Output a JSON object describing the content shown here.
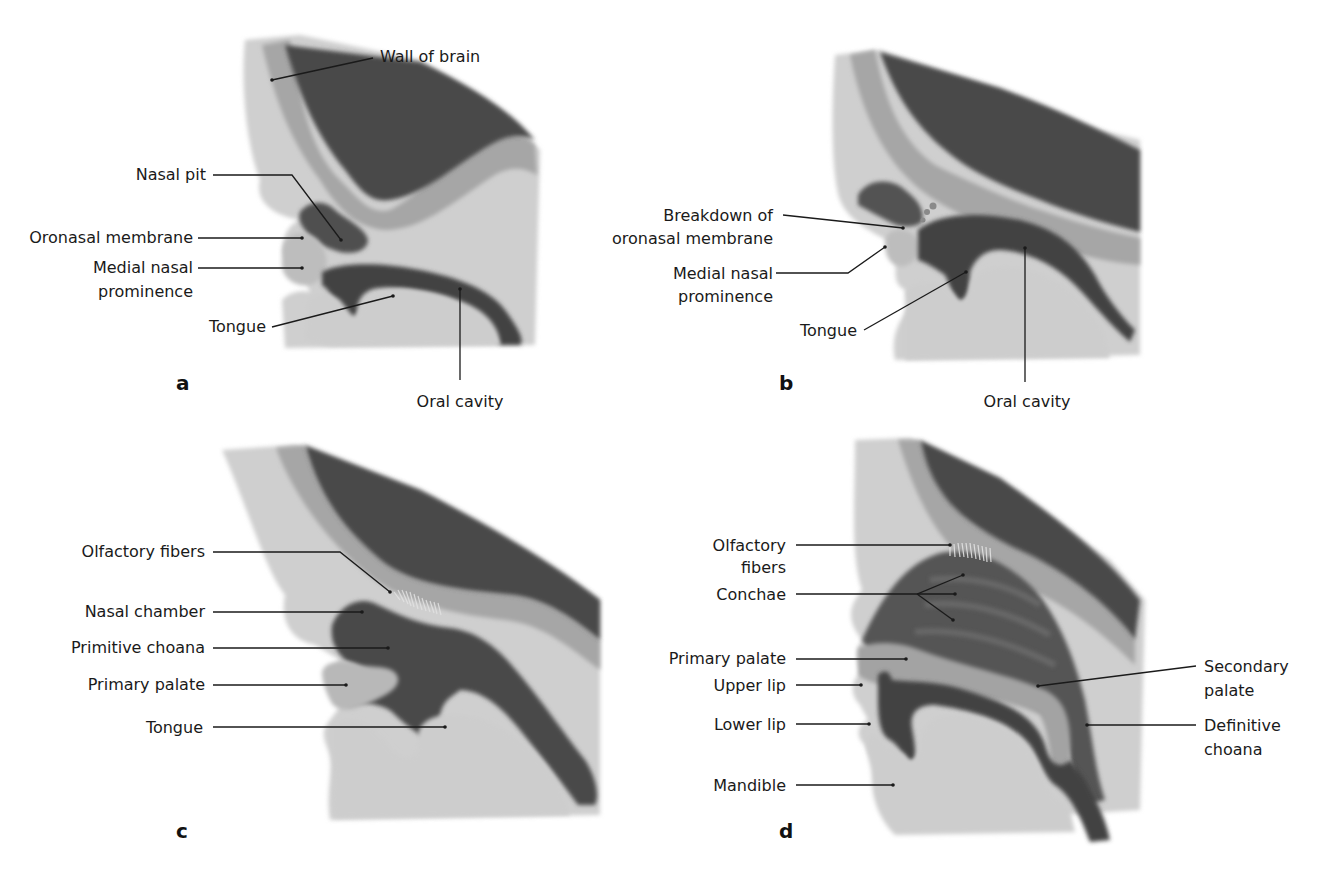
{
  "figure": {
    "colors": {
      "tissue_light": "#cfcfcf",
      "tissue_mid": "#a6a6a6",
      "cavity_dark": "#4d4d4d",
      "brain_dark": "#4a4a4a",
      "background": "#ffffff",
      "text": "#1a1a1a"
    },
    "panels": [
      {
        "letter": "a",
        "labels": {
          "wall_of_brain": "Wall of brain",
          "nasal_pit": "Nasal pit",
          "oronasal_membrane": "Oronasal membrane",
          "medial_nasal_1": "Medial nasal",
          "medial_nasal_2": "prominence",
          "tongue": "Tongue",
          "oral_cavity": "Oral cavity"
        }
      },
      {
        "letter": "b",
        "labels": {
          "breakdown_1": "Breakdown of",
          "breakdown_2": "oronasal membrane",
          "medial_nasal_1": "Medial nasal",
          "medial_nasal_2": "prominence",
          "tongue": "Tongue",
          "oral_cavity": "Oral cavity"
        }
      },
      {
        "letter": "c",
        "labels": {
          "olfactory_fibers": "Olfactory fibers",
          "nasal_chamber": "Nasal chamber",
          "primitive_choana": "Primitive choana",
          "primary_palate": "Primary palate",
          "tongue": "Tongue"
        }
      },
      {
        "letter": "d",
        "labels": {
          "olfactory_1": "Olfactory",
          "olfactory_2": "fibers",
          "conchae": "Conchae",
          "primary_palate": "Primary palate",
          "upper_lip": "Upper lip",
          "lower_lip": "Lower lip",
          "mandible": "Mandible",
          "secondary_palate_1": "Secondary",
          "secondary_palate_2": "palate",
          "definitive_choana_1": "Definitive",
          "definitive_choana_2": "choana"
        }
      }
    ]
  }
}
